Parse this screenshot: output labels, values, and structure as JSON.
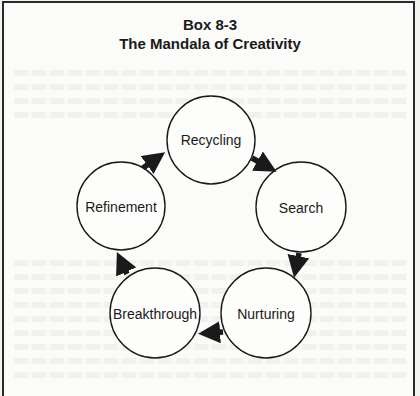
{
  "header": {
    "box_label": "Box 8-3",
    "title": "The Mandala of Creativity"
  },
  "diagram": {
    "type": "cycle",
    "direction": "clockwise",
    "nodes": [
      {
        "id": "recycling",
        "label": "Recycling",
        "cx": 211,
        "cy": 140,
        "r": 44
      },
      {
        "id": "search",
        "label": "Search",
        "cx": 301,
        "cy": 207,
        "r": 45
      },
      {
        "id": "nurturing",
        "label": "Nurturing",
        "cx": 266,
        "cy": 313,
        "r": 45
      },
      {
        "id": "breakthrough",
        "label": "Breakthrough",
        "cx": 155,
        "cy": 313,
        "r": 45
      },
      {
        "id": "refinement",
        "label": "Refinement",
        "cx": 121,
        "cy": 206,
        "r": 44
      }
    ],
    "edges": [
      {
        "from": "recycling",
        "to": "search"
      },
      {
        "from": "search",
        "to": "nurturing"
      },
      {
        "from": "nurturing",
        "to": "breakthrough"
      },
      {
        "from": "breakthrough",
        "to": "refinement"
      },
      {
        "from": "refinement",
        "to": "recycling"
      }
    ]
  },
  "colors": {
    "ink": "#1a1a1a",
    "paper": "#fbfbf9",
    "border": "#2a2a2a"
  }
}
